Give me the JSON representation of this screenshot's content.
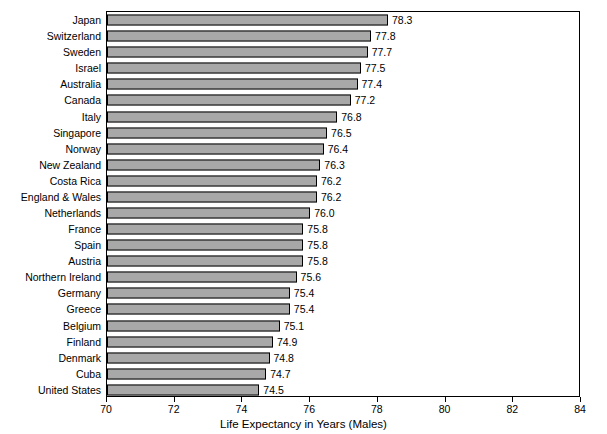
{
  "chart_data": {
    "type": "bar",
    "orientation": "horizontal",
    "title": "",
    "xlabel": "Life Expectancy in Years (Males)",
    "ylabel": "",
    "xlim": [
      70,
      84
    ],
    "xticks": [
      70,
      72,
      74,
      76,
      78,
      80,
      82,
      84
    ],
    "grid": false,
    "legend": null,
    "bar_color": "#a8a8a8",
    "bar_edge_color": "#000000",
    "categories": [
      "Japan",
      "Switzerland",
      "Sweden",
      "Israel",
      "Australia",
      "Canada",
      "Italy",
      "Singapore",
      "Norway",
      "New Zealand",
      "Costa Rica",
      "England & Wales",
      "Netherlands",
      "France",
      "Spain",
      "Austria",
      "Northern Ireland",
      "Germany",
      "Greece",
      "Belgium",
      "Finland",
      "Denmark",
      "Cuba",
      "United States"
    ],
    "values": [
      78.3,
      77.8,
      77.7,
      77.5,
      77.4,
      77.2,
      76.8,
      76.5,
      76.4,
      76.3,
      76.2,
      76.2,
      76.0,
      75.8,
      75.8,
      75.8,
      75.6,
      75.4,
      75.4,
      75.1,
      74.9,
      74.8,
      74.7,
      74.5
    ],
    "value_labels": [
      "78.3",
      "77.8",
      "77.7",
      "77.5",
      "77.4",
      "77.2",
      "76.8",
      "76.5",
      "76.4",
      "76.3",
      "76.2",
      "76.2",
      "76.0",
      "75.8",
      "75.8",
      "75.8",
      "75.6",
      "75.4",
      "75.4",
      "75.1",
      "74.9",
      "74.8",
      "74.7",
      "74.5"
    ]
  }
}
